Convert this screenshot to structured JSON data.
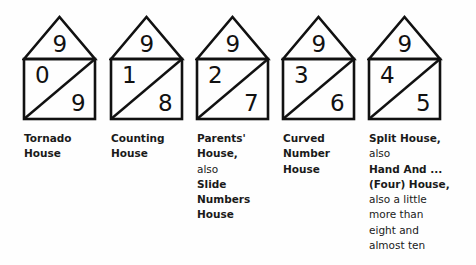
{
  "houses": [
    {
      "roof": "9",
      "left": "0",
      "right": "9",
      "caption": [
        {
          "t": "Tornado",
          "bold": true
        },
        {
          "t": "House",
          "bold": true
        }
      ]
    },
    {
      "roof": "9",
      "left": "1",
      "right": "8",
      "caption": [
        {
          "t": "Counting",
          "bold": true
        },
        {
          "t": "House",
          "bold": true
        }
      ]
    },
    {
      "roof": "9",
      "left": "2",
      "right": "7",
      "caption": [
        {
          "t": "Parents'",
          "bold": true
        },
        {
          "t": "House,",
          "bold": true
        },
        {
          "t": "also",
          "bold": false
        },
        {
          "t": "Slide",
          "bold": true
        },
        {
          "t": "Numbers",
          "bold": true
        },
        {
          "t": "House",
          "bold": true
        }
      ]
    },
    {
      "roof": "9",
      "left": "3",
      "right": "6",
      "caption": [
        {
          "t": "Curved",
          "bold": true
        },
        {
          "t": "Number",
          "bold": true
        },
        {
          "t": "House",
          "bold": true
        }
      ]
    },
    {
      "roof": "9",
      "left": "4",
      "right": "5",
      "caption": [
        {
          "t": "Split House,",
          "bold": true
        },
        {
          "t": "also",
          "bold": false
        },
        {
          "t": "Hand And ...",
          "bold": true
        },
        {
          "t": "(Four) House,",
          "bold": true
        },
        {
          "t": "also a little",
          "bold": false
        },
        {
          "t": "more than",
          "bold": false
        },
        {
          "t": "eight and",
          "bold": false
        },
        {
          "t": "almost ten",
          "bold": false
        }
      ]
    }
  ]
}
